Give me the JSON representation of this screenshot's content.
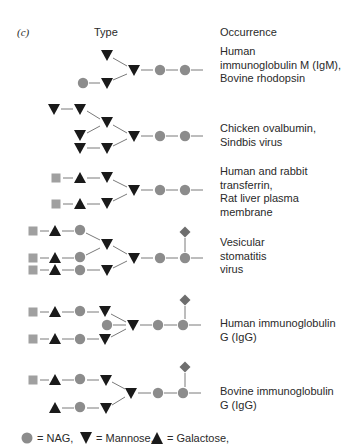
{
  "panel_label": "(c)",
  "headers": {
    "type": "Type",
    "occurrence": "Occurrence"
  },
  "colors": {
    "nag": "#8c8c8c",
    "mannose": "#1a1a1a",
    "galactose": "#1a1a1a",
    "square": "#a0a0a0",
    "fucose_diamond": "#6e6e6e",
    "link": "#7a7a7a"
  },
  "rows": [
    {
      "occurrence": [
        "Human",
        "immunoglobulin M (IgM),",
        "Bovine rhodopsin"
      ]
    },
    {
      "occurrence": [
        "Chicken ovalbumin,",
        "Sindbis virus"
      ]
    },
    {
      "occurrence": [
        "Human and rabbit",
        "transferrin,",
        "Rat liver plasma",
        "membrane"
      ]
    },
    {
      "occurrence": [
        "Vesicular",
        "stomatitis",
        "virus"
      ]
    },
    {
      "occurrence": [
        "Human immunoglobulin",
        "G (IgG)"
      ]
    },
    {
      "occurrence": [
        "Bovine immunoglobulin",
        "G (IgG)"
      ]
    }
  ],
  "legend": {
    "nag": "= NAG,",
    "mannose": "= Mannose,",
    "galactose": "= Galactose,"
  }
}
